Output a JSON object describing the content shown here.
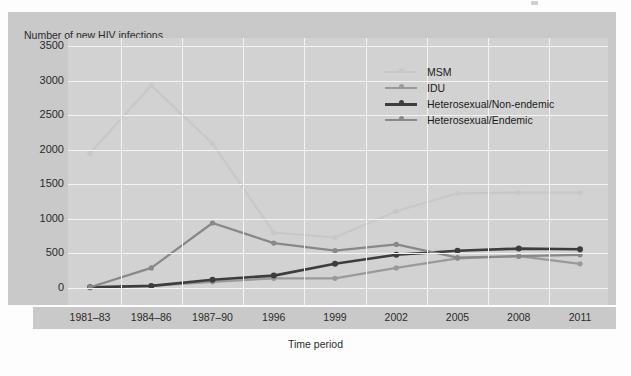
{
  "axis_title_y": "Number of new HIV infections",
  "axis_title_x": "Time period",
  "legend": {
    "items": [
      {
        "label": "MSM",
        "color": "#c8c8c8"
      },
      {
        "label": "IDU",
        "color": "#9a9a9a"
      },
      {
        "label": "Heterosexual/Non-endemic",
        "color": "#3d3d3d"
      },
      {
        "label": "Heterosexual/Endemic",
        "color": "#888888"
      }
    ]
  },
  "yticks": [
    "3500",
    "3000",
    "2500",
    "2000",
    "1500",
    "1000",
    "500",
    "0"
  ],
  "xticks": [
    "1981–83",
    "1984–86",
    "1987–90",
    "1996",
    "1999",
    "2002",
    "2005",
    "2008",
    "2011"
  ],
  "chart_data": {
    "type": "line",
    "title": "",
    "xlabel": "Time period",
    "ylabel": "Number of new HIV infections",
    "categories": [
      "1981–83",
      "1984–86",
      "1987–90",
      "1996",
      "1999",
      "2002",
      "2005",
      "2008",
      "2011"
    ],
    "ylim": [
      0,
      3500
    ],
    "ytick_step": 500,
    "grid": true,
    "legend_position": "upper-right-inside",
    "series": [
      {
        "name": "MSM",
        "color": "#c8c8c8",
        "values": [
          1950,
          2930,
          2090,
          800,
          730,
          1110,
          1370,
          1380,
          1380
        ]
      },
      {
        "name": "IDU",
        "color": "#9a9a9a",
        "values": [
          10,
          30,
          90,
          140,
          140,
          290,
          430,
          460,
          350
        ]
      },
      {
        "name": "Heterosexual/Non-endemic",
        "color": "#3d3d3d",
        "values": [
          10,
          30,
          120,
          180,
          350,
          480,
          540,
          570,
          560
        ]
      },
      {
        "name": "Heterosexual/Endemic",
        "color": "#888888",
        "values": [
          10,
          290,
          940,
          650,
          540,
          630,
          440,
          460,
          480
        ]
      }
    ]
  }
}
